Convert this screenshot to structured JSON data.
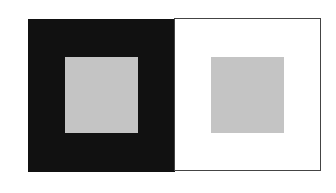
{
  "figure": {
    "left_panel": {
      "background": "#111111",
      "square_color": "#c4c4c4"
    },
    "right_panel": {
      "background": "#ffffff",
      "border": "#444444",
      "square_color": "#c4c4c4"
    }
  }
}
